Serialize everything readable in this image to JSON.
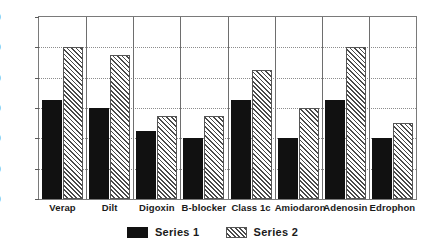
{
  "chart_data": {
    "type": "bar",
    "title": "",
    "xlabel": "",
    "ylabel": "",
    "ylim": [
      0,
      120
    ],
    "yticks": [
      0,
      20,
      40,
      60,
      80,
      100,
      120
    ],
    "grid": true,
    "legend_position": "bottom-center",
    "categories": [
      "Verap",
      "Dilt",
      "Digoxin",
      "B-blocker",
      "Class 1c",
      "Amiodaron",
      "Adenosin",
      "Edrophon"
    ],
    "series": [
      {
        "name": "Series 1",
        "values": [
          65,
          60,
          45,
          40,
          65,
          40,
          65,
          40
        ],
        "color": "#111111",
        "fill": "solid"
      },
      {
        "name": "Series 2",
        "values": [
          100,
          95,
          55,
          55,
          85,
          60,
          100,
          50
        ],
        "color": "#4a4a4a",
        "fill": "diagonal-hatch"
      }
    ]
  },
  "axis": {
    "y_tick_labels": [
      "120",
      "100",
      "80",
      "60",
      "40",
      "20",
      "0"
    ]
  },
  "legend": {
    "items": [
      {
        "label": "Series 1"
      },
      {
        "label": "Series 2"
      }
    ]
  }
}
